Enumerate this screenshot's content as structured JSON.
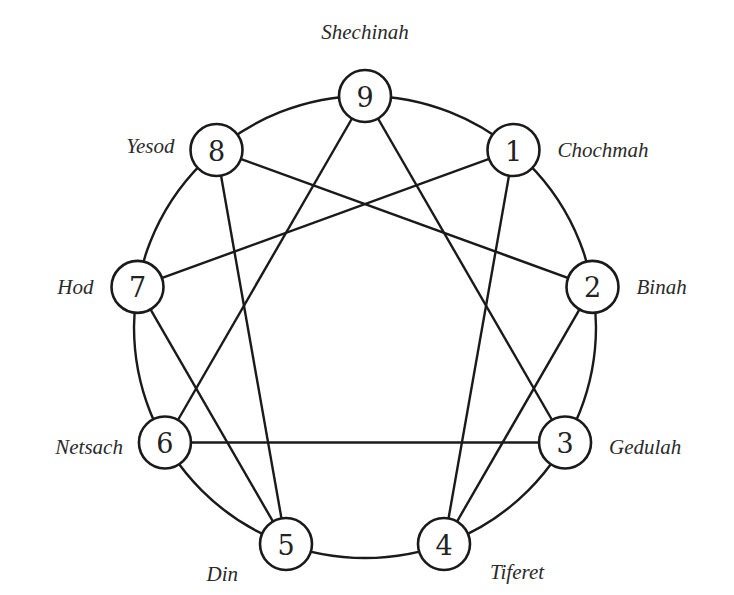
{
  "diagram": {
    "type": "enneagram",
    "line_color": "#1a1a1a",
    "background": "#ffffff",
    "nodes": [
      {
        "id": 9,
        "number": "9",
        "label": "Shechinah"
      },
      {
        "id": 1,
        "number": "1",
        "label": "Chochmah"
      },
      {
        "id": 2,
        "number": "2",
        "label": "Binah"
      },
      {
        "id": 3,
        "number": "3",
        "label": "Gedulah"
      },
      {
        "id": 4,
        "number": "4",
        "label": "Tiferet"
      },
      {
        "id": 5,
        "number": "5",
        "label": "Din"
      },
      {
        "id": 6,
        "number": "6",
        "label": "Netsach"
      },
      {
        "id": 7,
        "number": "7",
        "label": "Hod"
      },
      {
        "id": 8,
        "number": "8",
        "label": "Yesod"
      }
    ],
    "connections": [
      [
        9,
        3
      ],
      [
        9,
        6
      ],
      [
        3,
        6
      ],
      [
        1,
        4
      ],
      [
        4,
        2
      ],
      [
        2,
        8
      ],
      [
        8,
        5
      ],
      [
        5,
        7
      ],
      [
        7,
        1
      ]
    ]
  }
}
